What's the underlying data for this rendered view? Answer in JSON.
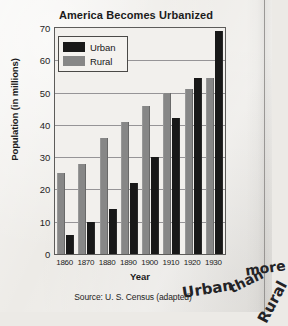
{
  "chart_data": {
    "type": "bar",
    "title": "America Becomes Urbanized",
    "xlabel": "Year",
    "ylabel": "Population (in millions)",
    "categories": [
      "1860",
      "1870",
      "1880",
      "1890",
      "1900",
      "1910",
      "1920",
      "1930"
    ],
    "series": [
      {
        "name": "Urban",
        "color": "#181818",
        "values": [
          6,
          10,
          14,
          22,
          30,
          42,
          54.5,
          69
        ]
      },
      {
        "name": "Rural",
        "color": "#878787",
        "values": [
          25,
          28,
          36,
          41,
          46,
          50,
          51,
          54.5
        ]
      }
    ],
    "ylim": [
      0,
      70
    ],
    "yticks": [
      0,
      10,
      20,
      30,
      40,
      50,
      60,
      70
    ],
    "grid": true,
    "legend_position": "top-left",
    "source": "Source: U. S. Census (adapted)"
  },
  "annotation": {
    "words": [
      "Urban",
      "more",
      "than",
      "Rural"
    ]
  }
}
